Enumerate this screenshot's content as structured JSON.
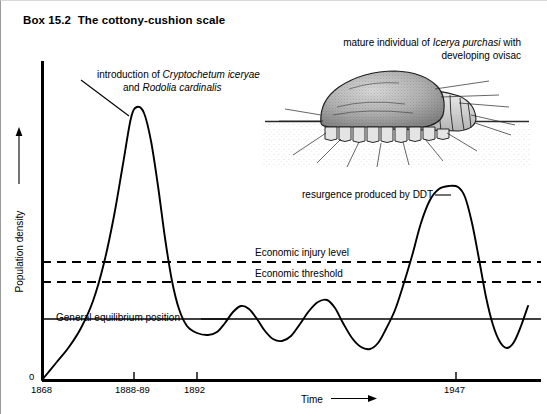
{
  "box": {
    "title": "Box 15.2  The cottony-cushion scale"
  },
  "chart_data": {
    "type": "line",
    "title": "The cottony-cushion scale",
    "xlabel": "Time",
    "ylabel": "Population density",
    "x_tick_labels": [
      "1868",
      "1888-89",
      "1892",
      "1947"
    ],
    "x_tick_positions_px": [
      41,
      133,
      196,
      455
    ],
    "y_origin_label": "0",
    "grid": false,
    "legend": "none",
    "axis_arrows": {
      "x": "right",
      "y": "up"
    },
    "reference_lines": [
      {
        "name": "economic-injury-level",
        "label": "Economic injury level",
        "style": "dashed",
        "y_px": 261
      },
      {
        "name": "economic-threshold",
        "label": "Economic threshold",
        "style": "dashed",
        "y_px": 281
      },
      {
        "name": "general-equilibrium-position",
        "label": "General equilibrium position",
        "style": "solid",
        "y_px": 318
      }
    ],
    "series": [
      {
        "name": "population-density-curve",
        "description": "Icerya purchasi population density over time: rapid rise to outbreak peak at 1888-89, crash after introduction of natural enemies in 1888-89, low stable oscillation about the general equilibrium position, then a sharp DDT-induced resurgence at 1947 exceeding the economic injury level, followed by return to oscillation.",
        "points_px": [
          [
            41,
            379
          ],
          [
            55,
            362
          ],
          [
            68,
            346
          ],
          [
            80,
            327
          ],
          [
            92,
            300
          ],
          [
            103,
            262
          ],
          [
            113,
            215
          ],
          [
            122,
            163
          ],
          [
            130,
            117
          ],
          [
            136,
            106
          ],
          [
            143,
            112
          ],
          [
            150,
            140
          ],
          [
            157,
            185
          ],
          [
            164,
            237
          ],
          [
            171,
            280
          ],
          [
            178,
            308
          ],
          [
            186,
            325
          ],
          [
            196,
            332
          ],
          [
            207,
            334
          ],
          [
            216,
            331
          ],
          [
            224,
            322
          ],
          [
            232,
            311
          ],
          [
            240,
            305
          ],
          [
            248,
            308
          ],
          [
            256,
            318
          ],
          [
            264,
            330
          ],
          [
            272,
            338
          ],
          [
            281,
            340
          ],
          [
            290,
            335
          ],
          [
            299,
            323
          ],
          [
            308,
            310
          ],
          [
            317,
            301
          ],
          [
            326,
            299
          ],
          [
            334,
            307
          ],
          [
            342,
            322
          ],
          [
            351,
            337
          ],
          [
            360,
            346
          ],
          [
            369,
            348
          ],
          [
            377,
            342
          ],
          [
            385,
            328
          ],
          [
            394,
            309
          ],
          [
            402,
            285
          ],
          [
            411,
            255
          ],
          [
            420,
            222
          ],
          [
            429,
            199
          ],
          [
            438,
            188
          ],
          [
            448,
            185
          ],
          [
            457,
            186
          ],
          [
            464,
            196
          ],
          [
            471,
            222
          ],
          [
            478,
            258
          ],
          [
            485,
            296
          ],
          [
            492,
            324
          ],
          [
            499,
            341
          ],
          [
            506,
            347
          ],
          [
            513,
            341
          ],
          [
            520,
            325
          ],
          [
            527,
            305
          ]
        ]
      }
    ]
  },
  "annotations": [
    {
      "name": "introduction-annotation",
      "line1_plain": "introduction of ",
      "line1_italic": "Cryptochetum iceryae",
      "line2_plain": "and ",
      "line2_italic": "Rodolia cardinalis"
    },
    {
      "name": "mature-individual-annotation",
      "line1_plain_a": "mature individual of ",
      "line1_italic": "Icerya purchasi",
      "line1_plain_b": " with",
      "line2_plain": "developing ovisac"
    },
    {
      "name": "ddt-resurgence-annotation",
      "text": "resurgence produced by DDT"
    }
  ],
  "labels": {
    "economic_injury_level": "Economic injury level",
    "economic_threshold": "Economic threshold",
    "general_equilibrium_position": "General equilibrium position",
    "time_axis": "Time",
    "population_density_axis": "Population density",
    "zero": "0",
    "tick_1868": "1868",
    "tick_1888_89": "1888-89",
    "tick_1892": "1892",
    "tick_1947": "1947"
  },
  "colors": {
    "ink": "#000000",
    "paper": "#ffffff",
    "border": "#9a9a9a",
    "illustration_gray": "#8a8a8a"
  }
}
